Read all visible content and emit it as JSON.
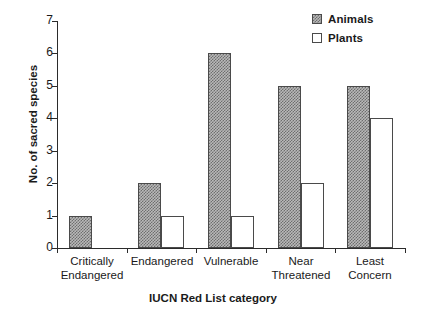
{
  "chart_data": {
    "type": "bar",
    "title": "",
    "xlabel": "IUCN Red List category",
    "ylabel": "No. of sacred species",
    "categories": [
      "Critically\nEndangered",
      "Endangered",
      "Vulnerable",
      "Near\nThreatened",
      "Least\nConcern"
    ],
    "category_lines": [
      [
        "Critically",
        "Endangered"
      ],
      [
        "Endangered"
      ],
      [
        "Vulnerable"
      ],
      [
        "Near",
        "Threatened"
      ],
      [
        "Least",
        "Concern"
      ]
    ],
    "series": [
      {
        "name": "Animals",
        "values": [
          1,
          2,
          6,
          5,
          5
        ],
        "fill": "checkered-gray",
        "color": "#b9b9b9"
      },
      {
        "name": "Plants",
        "values": [
          0,
          1,
          1,
          2,
          4
        ],
        "fill": "white",
        "color": "#ffffff"
      }
    ],
    "ylim": [
      0,
      7
    ],
    "yticks": [
      0,
      1,
      2,
      3,
      4,
      5,
      6,
      7
    ],
    "ytick_labels": [
      "0",
      "1",
      "2",
      "3",
      "4",
      "5",
      "6",
      "7"
    ],
    "grid": false,
    "legend_position": "top-right",
    "legend_entries": [
      "Animals",
      "Plants"
    ]
  },
  "legend": {
    "items": [
      {
        "label": "Animals"
      },
      {
        "label": "Plants"
      }
    ]
  },
  "axes": {
    "y_title": "No. of sacred species",
    "x_title": "IUCN Red List category"
  }
}
